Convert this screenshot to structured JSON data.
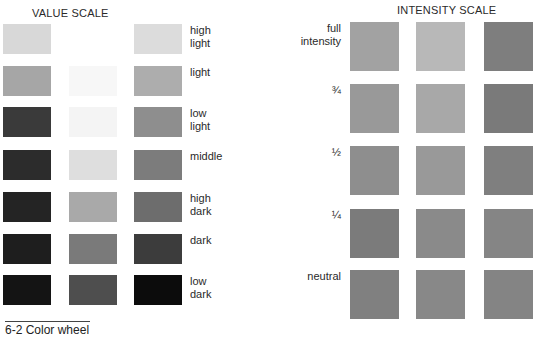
{
  "value_scale": {
    "title": "VALUE SCALE",
    "rows": [
      {
        "label": "high\nlight",
        "colors": [
          "#d8d8d8",
          "#ffffff",
          "#dcdcdc"
        ]
      },
      {
        "label": "light",
        "colors": [
          "#a6a6a6",
          "#f7f7f7",
          "#adadad"
        ]
      },
      {
        "label": "low\nlight",
        "colors": [
          "#3a3a3a",
          "#f4f4f4",
          "#8e8e8e"
        ]
      },
      {
        "label": "middle",
        "colors": [
          "#2c2c2c",
          "#dedede",
          "#7c7c7c"
        ]
      },
      {
        "label": "high\ndark",
        "colors": [
          "#242424",
          "#a9a9a9",
          "#6d6d6d"
        ]
      },
      {
        "label": "dark",
        "colors": [
          "#1e1e1e",
          "#7a7a7a",
          "#3c3c3c"
        ]
      },
      {
        "label": "low\ndark",
        "colors": [
          "#141414",
          "#4e4e4e",
          "#0c0c0c"
        ]
      }
    ]
  },
  "intensity_scale": {
    "title": "INTENSITY SCALE",
    "rows": [
      {
        "label": "full\nintensity",
        "colors": [
          "#a2a2a2",
          "#b8b8b8",
          "#7e7e7e"
        ]
      },
      {
        "label": "¾",
        "colors": [
          "#999999",
          "#a8a8a8",
          "#7a7a7a"
        ]
      },
      {
        "label": "½",
        "colors": [
          "#8e8e8e",
          "#999999",
          "#7f7f7f"
        ]
      },
      {
        "label": "¼",
        "colors": [
          "#7b7b7b",
          "#8a8a8a",
          "#858585"
        ]
      },
      {
        "label": "neutral",
        "colors": [
          "#808080",
          "#888888",
          "#848484"
        ]
      }
    ]
  },
  "caption": "6-2 Color wheel"
}
